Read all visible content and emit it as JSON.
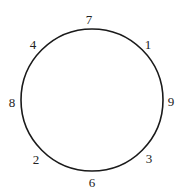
{
  "diagram": {
    "circle": {
      "cx": 92,
      "cy": 100,
      "r": 71,
      "stroke": "#1a1a1a"
    },
    "labels": [
      {
        "text": "7",
        "x": 89,
        "y": 24
      },
      {
        "text": "1",
        "x": 148,
        "y": 49
      },
      {
        "text": "9",
        "x": 171,
        "y": 106
      },
      {
        "text": "3",
        "x": 149,
        "y": 163
      },
      {
        "text": "6",
        "x": 92,
        "y": 187
      },
      {
        "text": "2",
        "x": 36,
        "y": 164
      },
      {
        "text": "8",
        "x": 12,
        "y": 107
      },
      {
        "text": "4",
        "x": 33,
        "y": 49
      }
    ]
  }
}
